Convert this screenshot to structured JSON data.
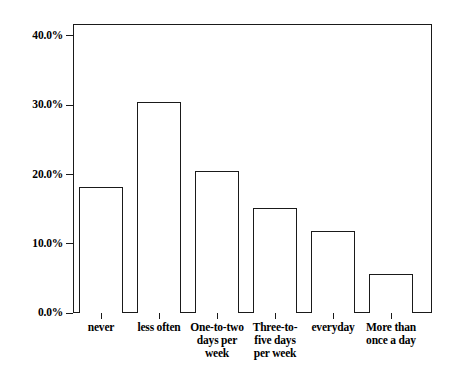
{
  "chart_data": {
    "type": "bar",
    "title": "",
    "xlabel": "",
    "ylabel": "",
    "categories": [
      "never",
      "less often",
      "One-to-two days per week",
      "Three-to-five days per week",
      "everyday",
      "More than once a day"
    ],
    "category_lines": [
      [
        "never"
      ],
      [
        "less often"
      ],
      [
        "One-to-two",
        "days per",
        "week"
      ],
      [
        "Three-to-",
        "five days",
        "per week"
      ],
      [
        "everyday"
      ],
      [
        "More than",
        "once a day"
      ]
    ],
    "values": [
      18.2,
      30.5,
      20.5,
      15.2,
      11.8,
      5.6
    ],
    "value_labels": [
      "18.2%",
      "30.5%",
      "20.5%",
      "15.2%",
      "11.8%",
      "5.6%"
    ],
    "ylim": [
      0,
      41.7
    ],
    "yticks": [
      0,
      10,
      20,
      30,
      40
    ],
    "ytick_labels": [
      "0.0%",
      "10.0%",
      "20.0%",
      "30.0%",
      "40.0%"
    ],
    "grid": false,
    "legend": null,
    "bar_fill_color": "#ffffff",
    "bar_edge_color": "#1a1a1a",
    "axis_color": "#1a1a1a",
    "background_color": "#ffffff"
  }
}
